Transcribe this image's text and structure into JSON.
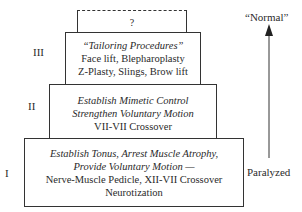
{
  "levels": {
    "top": {
      "label": "?"
    },
    "three": {
      "numeral": "III",
      "heading": "“Tailoring Procedures”",
      "lines": [
        "Face lift, Blepharoplasty",
        "Z-Plasty, Slings, Brow lift"
      ]
    },
    "two": {
      "numeral": "II",
      "goals": [
        "Establish Mimetic Control",
        "Strengthen Voluntary Motion"
      ],
      "lines": [
        "VII-VII Crossover"
      ]
    },
    "one": {
      "numeral": "I",
      "goals": [
        "Establish Tonus, Arrest Muscle Atrophy,",
        "Provide Voluntary Motion —"
      ],
      "lines": [
        "Nerve-Muscle Pedicle, XII-VII Crossover",
        "Neurotization"
      ]
    }
  },
  "scale": {
    "top_label": "“Normal”",
    "bottom_label": "Paralyzed",
    "direction": "up"
  }
}
